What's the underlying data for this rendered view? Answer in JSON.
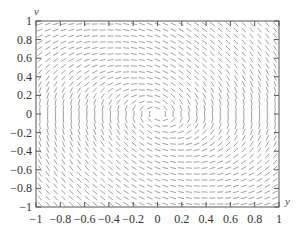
{
  "chart_data": {
    "type": "direction-field",
    "title": "",
    "xlabel": "y",
    "ylabel": "v",
    "xlim": [
      -1,
      1
    ],
    "ylim": [
      -1,
      1
    ],
    "x_ticks": [
      "−1",
      "−0.8",
      "−0.6",
      "−0.4",
      "−0.2",
      "0",
      "0.2",
      "0.4",
      "0.6",
      "0.8",
      "1"
    ],
    "y_ticks": [
      "−1",
      "−0.8",
      "−0.6",
      "−0.4",
      "−0.2",
      "0",
      "0.2",
      "0.4",
      "0.6",
      "0.8",
      "1"
    ],
    "grid": false,
    "field": {
      "description": "slope field dv/dy = (-y - c*v)/v, spiral about origin",
      "damping_c": 0.5,
      "columns": 31,
      "rows": 31
    },
    "plot_box_px": {
      "left": 36,
      "top": 21,
      "right": 279,
      "bottom": 207
    },
    "colors": {
      "axis": "#555555",
      "segment": "#888888",
      "text": "#333333"
    }
  }
}
